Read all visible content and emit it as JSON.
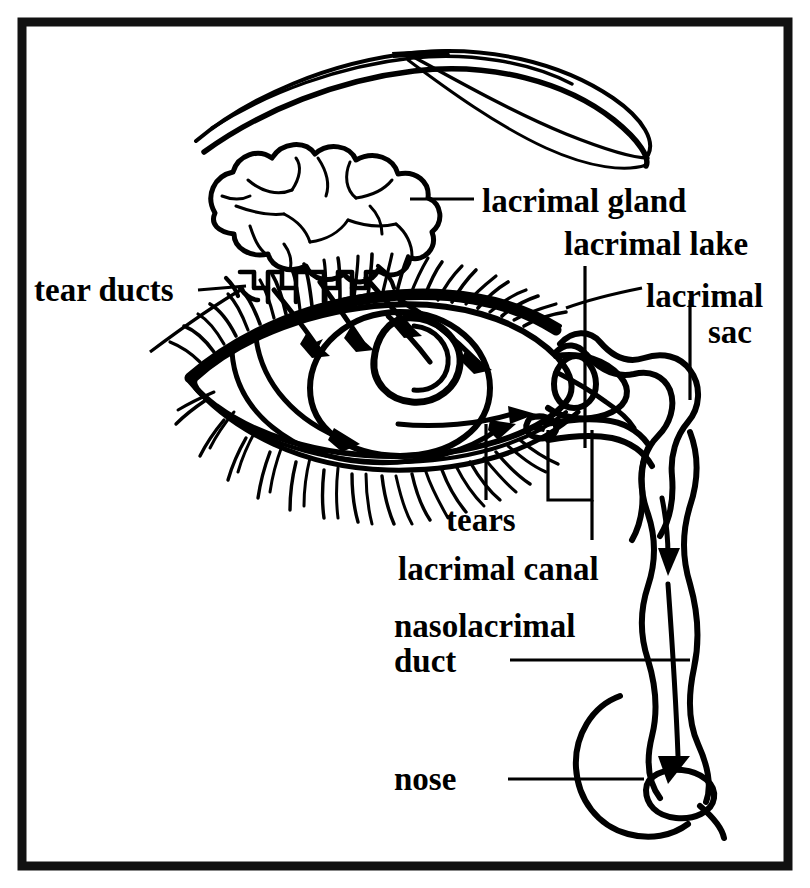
{
  "figure": {
    "type": "anatomical-line-drawing",
    "border_color": "#111111",
    "ink_color": "#000000",
    "background_color": "#ffffff"
  },
  "labels": {
    "lacrimal_gland": "lacrimal gland",
    "lacrimal_lake": "lacrimal lake",
    "lacrimal_sac_line1": "lacrimal",
    "lacrimal_sac_line2": "sac",
    "tear_ducts": "tear ducts",
    "tears": "tears",
    "lacrimal_canal": "lacrimal canal",
    "nasolacrimal_duct_line1": "nasolacrimal",
    "nasolacrimal_duct_line2": "duct",
    "nose": "nose"
  },
  "structures": [
    {
      "name": "eyebrow",
      "label": null
    },
    {
      "name": "lacrimal-gland",
      "label": "lacrimal gland"
    },
    {
      "name": "tear-ducts",
      "label": "tear ducts"
    },
    {
      "name": "upper-eyelid-lashes",
      "label": null
    },
    {
      "name": "lower-eyelid-lashes",
      "label": null
    },
    {
      "name": "iris",
      "label": null
    },
    {
      "name": "pupil",
      "label": null
    },
    {
      "name": "tear-flow-arrows",
      "label": "tears"
    },
    {
      "name": "lacrimal-lake",
      "label": "lacrimal lake"
    },
    {
      "name": "lacrimal-punctum",
      "label": null
    },
    {
      "name": "lacrimal-canal",
      "label": "lacrimal canal"
    },
    {
      "name": "lacrimal-sac",
      "label": "lacrimal sac"
    },
    {
      "name": "nasolacrimal-duct",
      "label": "nasolacrimal duct"
    },
    {
      "name": "nose",
      "label": "nose"
    }
  ]
}
